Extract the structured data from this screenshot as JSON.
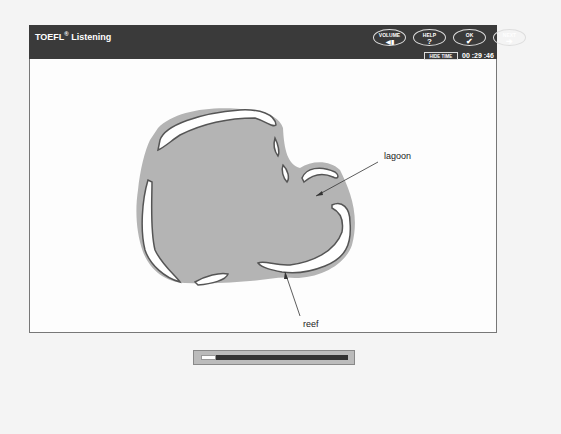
{
  "header": {
    "title": "TOEFL",
    "title_mark": "®",
    "section": "Listening",
    "buttons": [
      {
        "label": "VOLUME",
        "icon": "speaker-icon",
        "glyph": "◀▮"
      },
      {
        "label": "HELP",
        "icon": "question-icon",
        "glyph": "?"
      },
      {
        "label": "OK",
        "icon": "check-icon",
        "glyph": "✔"
      },
      {
        "label": "NEXT",
        "icon": "arrow-right-icon",
        "glyph": "➔"
      }
    ],
    "hide_time_label": "HIDE TIME",
    "timer": "00 :29 :46"
  },
  "diagram": {
    "labels": {
      "lagoon": "lagoon",
      "reef": "reef"
    },
    "colors": {
      "water": "#b4b4b4",
      "reef_fill": "#ffffff",
      "reef_outline": "#555555"
    }
  },
  "audio_progress": {
    "percent": 10
  }
}
